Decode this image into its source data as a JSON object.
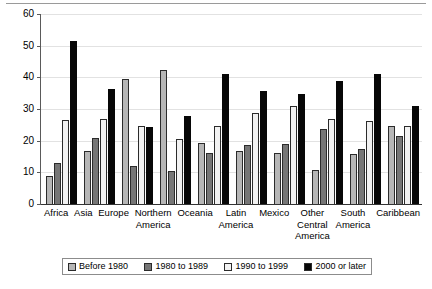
{
  "chart_data": {
    "type": "bar",
    "title": "",
    "xlabel": "",
    "ylabel": "",
    "ylim": [
      0,
      60
    ],
    "yticks": [
      0,
      10,
      20,
      30,
      40,
      50,
      60
    ],
    "grid": true,
    "legend_position": "bottom",
    "categories": [
      "Africa",
      "Asia",
      "Europe",
      "Northern\nAmerica",
      "Oceania",
      "Latin\nAmerica",
      "Mexico",
      "Other\nCentral\nAmerica",
      "South\nAmerica",
      "Caribbean"
    ],
    "series": [
      {
        "name": "Before 1980",
        "color": "#b6b6b6",
        "values": [
          9.0,
          16.7,
          39.6,
          42.2,
          19.4,
          16.6,
          16.1,
          10.8,
          15.8,
          24.7
        ]
      },
      {
        "name": "1980 to 1989",
        "color": "#767676",
        "values": [
          13.0,
          20.8,
          11.9,
          10.3,
          16.1,
          18.5,
          18.8,
          23.6,
          17.5,
          21.4
        ]
      },
      {
        "name": "1990 to 1999",
        "color": "#f2f2f2",
        "values": [
          26.5,
          26.7,
          24.5,
          20.6,
          24.6,
          28.7,
          30.8,
          26.8,
          26.2,
          24.5
        ]
      },
      {
        "name": "2000 or later",
        "color": "#070707",
        "values": [
          51.5,
          36.3,
          24.3,
          27.8,
          41.2,
          35.7,
          34.8,
          38.9,
          41.2,
          30.8
        ]
      }
    ]
  }
}
